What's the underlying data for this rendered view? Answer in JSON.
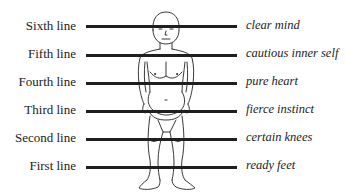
{
  "diagram": {
    "line_color": "#1f1f1f",
    "lines": [
      {
        "name": "Sixth line",
        "quality": "clear mind",
        "y": 26
      },
      {
        "name": "Fifth line",
        "quality": "cautious inner self",
        "y": 55
      },
      {
        "name": "Fourth line",
        "quality": "pure heart",
        "y": 83
      },
      {
        "name": "Third line",
        "quality": "fierce instinct",
        "y": 110
      },
      {
        "name": "Second line",
        "quality": "certain knees",
        "y": 139
      },
      {
        "name": "First line",
        "quality": "ready feet",
        "y": 167
      }
    ],
    "figure": {
      "subject": "standing-human-figure-line-drawing"
    }
  }
}
